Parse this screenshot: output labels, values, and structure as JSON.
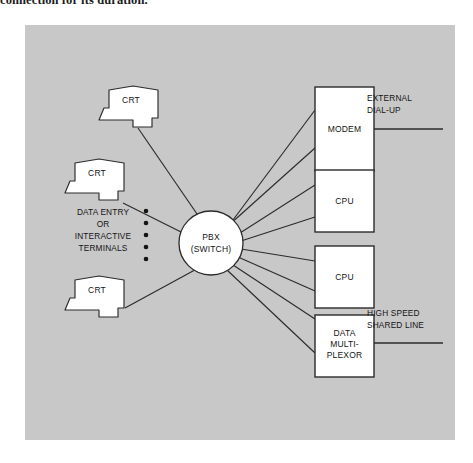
{
  "caption": {
    "text": "connection for its duration."
  },
  "figure": {
    "background_color": "#c8c8c8",
    "line_color": "#2b2b2b",
    "shape_fill": "#ffffff",
    "text_color": "#141414",
    "switch": {
      "label_line1": "PBX",
      "label_line2": "(SWITCH)"
    },
    "terminals": [
      {
        "label": "CRT",
        "name": "crt-terminal-top"
      },
      {
        "label": "CRT",
        "name": "crt-terminal-middle"
      },
      {
        "label": "CRT",
        "name": "crt-terminal-bottom"
      }
    ],
    "terminal_group_label": {
      "line1": "DATA ENTRY",
      "line2": "OR",
      "line3": "INTERACTIVE",
      "line4": "TERMINALS"
    },
    "ellipsis_dot_count": 5,
    "devices": [
      {
        "name": "modem-box",
        "label_line1": "MODEM",
        "label_line2": "",
        "label_line3": ""
      },
      {
        "name": "cpu-box-upper",
        "label_line1": "CPU",
        "label_line2": "",
        "label_line3": ""
      },
      {
        "name": "cpu-box-lower",
        "label_line1": "CPU",
        "label_line2": "",
        "label_line3": ""
      },
      {
        "name": "data-multiplexor-box",
        "label_line1": "DATA",
        "label_line2": "MULTI-",
        "label_line3": "PLEXOR"
      }
    ],
    "external_line_labels": [
      {
        "name": "external-dial-up-label",
        "line1": "EXTERNAL",
        "line2": "DIAL-UP"
      },
      {
        "name": "high-speed-shared-line-label",
        "line1": "HIGH SPEED",
        "line2": "SHARED LINE"
      }
    ]
  }
}
